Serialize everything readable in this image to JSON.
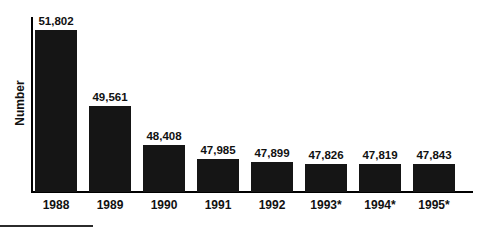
{
  "chart_data": {
    "type": "bar",
    "title": "",
    "subtitle": "",
    "xlabel": "",
    "ylabel": "Number",
    "categories": [
      "1988",
      "1989",
      "1990",
      "1991",
      "1992",
      "1993*",
      "1994*",
      "1995*"
    ],
    "values": [
      51802,
      49561,
      48408,
      47985,
      47899,
      47826,
      47819,
      47843
    ],
    "value_labels": [
      "51,802",
      "49,561",
      "48,408",
      "47,985",
      "47,899",
      "47,826",
      "47,819",
      "47,843"
    ],
    "ylim": [
      47000,
      52200
    ],
    "grid": false,
    "legend": null,
    "legend_position": "none",
    "annotations": [
      "* asterisk on 1993, 1994 and 1995 category labels"
    ],
    "bar_color": "#151515",
    "axis_color": "#000000",
    "background_color": "#ffffff"
  },
  "axis": {
    "y_label": "Number"
  },
  "bars": [
    {
      "category": "1988",
      "value_label": "51,802"
    },
    {
      "category": "1989",
      "value_label": "49,561"
    },
    {
      "category": "1990",
      "value_label": "48,408"
    },
    {
      "category": "1991",
      "value_label": "47,985"
    },
    {
      "category": "1992",
      "value_label": "47,899"
    },
    {
      "category": "1993*",
      "value_label": "47,826"
    },
    {
      "category": "1994*",
      "value_label": "47,819"
    },
    {
      "category": "1995*",
      "value_label": "47,843"
    }
  ]
}
